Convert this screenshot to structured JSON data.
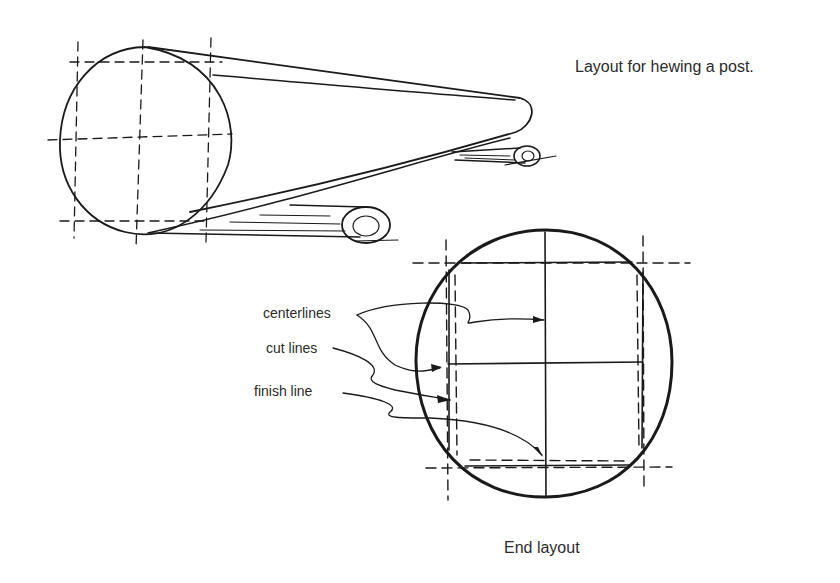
{
  "title": "Layout for hewing a post.",
  "caption": "End layout",
  "annotations": {
    "centerlines": "centerlines",
    "cut_lines": "cut lines",
    "finish_line": "finish line"
  },
  "colors": {
    "ink": "#1a1a1a",
    "text": "#2b2b2b",
    "background": "#ffffff"
  }
}
